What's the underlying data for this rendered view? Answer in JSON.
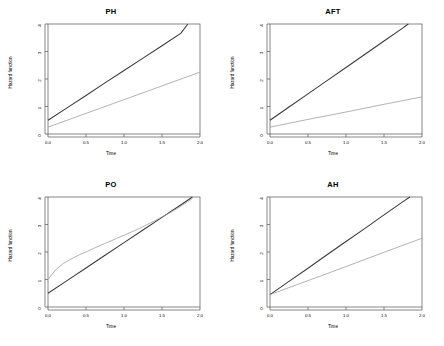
{
  "figure": {
    "background": "#ffffff",
    "layout": "2x2 grid of line plots",
    "panel_order": [
      "PH",
      "AFT",
      "PO",
      "AH"
    ]
  },
  "axis": {
    "xlabel": "Time",
    "ylabel": "Hazard function",
    "xticks": [
      "0.0",
      "0.5",
      "1.0",
      "1.5",
      "2.0"
    ],
    "xtick_values": [
      0.0,
      0.5,
      1.0,
      1.5,
      2.0
    ],
    "yticks": [
      "0",
      "1",
      "2",
      "3",
      "4"
    ],
    "ytick_values": [
      0,
      1,
      2,
      3,
      4
    ],
    "xlim": [
      0.0,
      2.0
    ],
    "ylim": [
      0,
      4
    ],
    "grid": false,
    "frame": true
  },
  "colors": {
    "line_dark": "#3a3a3a",
    "line_light": "#9a9a9a",
    "frame": "#555555",
    "text": "#000000",
    "background": "#ffffff"
  },
  "panels": [
    {
      "id": "ph",
      "title": "PH"
    },
    {
      "id": "aft",
      "title": "AFT"
    },
    {
      "id": "po",
      "title": "PO"
    },
    {
      "id": "ah",
      "title": "AH"
    }
  ],
  "chart_data": [
    {
      "type": "line",
      "title": "PH",
      "xlabel": "Time",
      "ylabel": "Hazard function",
      "xlim": [
        0.0,
        2.0
      ],
      "ylim": [
        0,
        4
      ],
      "grid": false,
      "series": [
        {
          "name": "group-1-steep",
          "color": "#3a3a3a",
          "x": [
            0.0,
            0.25,
            0.5,
            0.75,
            1.0,
            1.25,
            1.5,
            1.75,
            1.84
          ],
          "y": [
            0.5,
            0.95,
            1.4,
            1.86,
            2.31,
            2.76,
            3.21,
            3.67,
            4.0
          ]
        },
        {
          "name": "group-2-shallow",
          "color": "#9a9a9a",
          "x": [
            0.0,
            0.5,
            1.0,
            1.5,
            2.0
          ],
          "y": [
            0.25,
            0.75,
            1.25,
            1.75,
            2.25
          ]
        }
      ]
    },
    {
      "type": "line",
      "title": "AFT",
      "xlabel": "Time",
      "ylabel": "Hazard function",
      "xlim": [
        0.0,
        2.0
      ],
      "ylim": [
        0,
        4
      ],
      "grid": false,
      "series": [
        {
          "name": "group-1-steep",
          "color": "#3a3a3a",
          "x": [
            0.0,
            0.25,
            0.5,
            0.75,
            1.0,
            1.25,
            1.5,
            1.75,
            1.82
          ],
          "y": [
            0.5,
            0.98,
            1.46,
            1.94,
            2.42,
            2.9,
            3.38,
            3.86,
            4.0
          ]
        },
        {
          "name": "group-2-shallow",
          "color": "#9a9a9a",
          "x": [
            0.0,
            0.5,
            1.0,
            1.5,
            2.0
          ],
          "y": [
            0.25,
            0.53,
            0.8,
            1.08,
            1.35
          ]
        }
      ]
    },
    {
      "type": "line",
      "title": "PO",
      "xlabel": "Time",
      "ylabel": "Hazard function",
      "xlim": [
        0.0,
        2.0
      ],
      "ylim": [
        0,
        4
      ],
      "grid": false,
      "series": [
        {
          "name": "group-1-straight",
          "color": "#3a3a3a",
          "x": [
            0.0,
            0.25,
            0.5,
            0.75,
            1.0,
            1.25,
            1.5,
            1.75,
            1.9
          ],
          "y": [
            0.5,
            0.96,
            1.42,
            1.88,
            2.34,
            2.8,
            3.26,
            3.72,
            4.0
          ]
        },
        {
          "name": "group-2-curved",
          "color": "#9a9a9a",
          "x": [
            0.0,
            0.1,
            0.2,
            0.3,
            0.4,
            0.5,
            0.6,
            0.7,
            0.8,
            0.9,
            1.0,
            1.2,
            1.4,
            1.6,
            1.8,
            1.9
          ],
          "y": [
            1.0,
            1.35,
            1.58,
            1.74,
            1.88,
            2.0,
            2.13,
            2.25,
            2.37,
            2.49,
            2.61,
            2.85,
            3.13,
            3.42,
            3.75,
            3.95
          ]
        }
      ]
    },
    {
      "type": "line",
      "title": "AH",
      "xlabel": "Time",
      "ylabel": "Hazard function",
      "xlim": [
        0.0,
        2.0
      ],
      "ylim": [
        0,
        4
      ],
      "grid": false,
      "series": [
        {
          "name": "group-1-steep",
          "color": "#3a3a3a",
          "x": [
            0.0,
            0.25,
            0.5,
            0.75,
            1.0,
            1.25,
            1.5,
            1.75,
            1.84
          ],
          "y": [
            0.45,
            0.93,
            1.41,
            1.9,
            2.38,
            2.86,
            3.35,
            3.83,
            4.0
          ]
        },
        {
          "name": "group-2-shallow",
          "color": "#9a9a9a",
          "x": [
            0.0,
            0.5,
            1.0,
            1.5,
            2.0
          ],
          "y": [
            0.45,
            0.96,
            1.47,
            1.99,
            2.5
          ]
        }
      ]
    }
  ]
}
